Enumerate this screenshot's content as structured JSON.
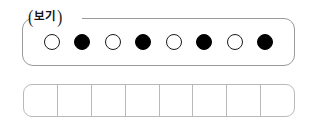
{
  "worksheet": {
    "legend": {
      "label": "보기",
      "bracket_left": "(",
      "bracket_right": ")",
      "border_color": "#9a9a9a"
    },
    "tokens": [
      {
        "index": 1,
        "fill": "white",
        "symbol": "○"
      },
      {
        "index": 2,
        "fill": "black",
        "symbol": "●"
      },
      {
        "index": 3,
        "fill": "white",
        "symbol": "○"
      },
      {
        "index": 4,
        "fill": "black",
        "symbol": "●"
      },
      {
        "index": 5,
        "fill": "white",
        "symbol": "○"
      },
      {
        "index": 6,
        "fill": "black",
        "symbol": "●"
      },
      {
        "index": 7,
        "fill": "white",
        "symbol": "○"
      },
      {
        "index": 8,
        "fill": "black",
        "symbol": "●"
      }
    ],
    "answer_grid": {
      "cell_count": 8,
      "cells": [
        "",
        "",
        "",
        "",
        "",
        "",
        "",
        ""
      ],
      "border_color": "#b9b9b9"
    },
    "colors": {
      "white_token_fill": "#ffffff",
      "white_token_stroke": "#1a1a1a",
      "black_token_fill": "#000000",
      "page_background": "#ffffff"
    }
  }
}
